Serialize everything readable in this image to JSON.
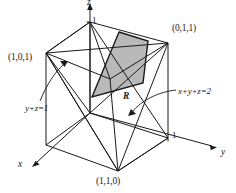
{
  "figure": {
    "colors": {
      "stroke": "#1a1a1a",
      "shade_fill": "#b9b9b9",
      "background": "#ffffff"
    },
    "axes": [
      {
        "name": "x-axis",
        "label": "x",
        "label_x": 18,
        "label_y": 168
      },
      {
        "name": "y-axis",
        "label": "y",
        "label_x": 221,
        "label_y": 155
      },
      {
        "name": "z-axis",
        "label": "z",
        "label_x": 88,
        "label_y": -1
      }
    ],
    "ticks": [
      {
        "name": "z-tick-1",
        "label": "1",
        "x": 92,
        "y": 18
      },
      {
        "name": "y-tick-1",
        "label": "1",
        "x": 180,
        "y": 134
      }
    ],
    "vertex_labels": [
      {
        "name": "vertex-label-101",
        "label": "(1,0,1)",
        "x": 10,
        "y": 58
      },
      {
        "name": "vertex-label-011",
        "label": "(0,1,1)",
        "x": 172,
        "y": 25
      },
      {
        "name": "vertex-label-110",
        "label": "(1,1,0)",
        "x": 97,
        "y": 176
      }
    ],
    "plane_labels": [
      {
        "name": "plane-label-yz1",
        "label": "y+z=1",
        "x": 26,
        "y": 107
      },
      {
        "name": "plane-label-xyz2",
        "label": "x+y+z=2",
        "x": 179,
        "y": 91
      }
    ],
    "region_label": {
      "name": "region-label-R",
      "label": "R",
      "x": 124,
      "y": 96
    }
  }
}
